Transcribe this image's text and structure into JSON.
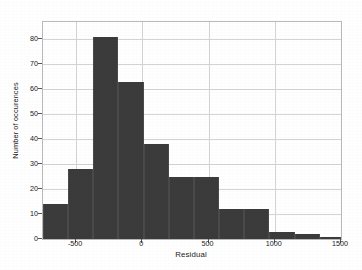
{
  "chart_data": {
    "type": "bar",
    "title": "",
    "subtitle": "",
    "xlabel": "Residual",
    "ylabel": "Number of occurences",
    "xlim": [
      -750,
      1500
    ],
    "ylim": [
      0,
      87
    ],
    "grid": true,
    "legend": null,
    "legend_position": "none",
    "bar_color": "#3b3b3b",
    "bin_width": 190,
    "xticks": [
      -500,
      0,
      500,
      1000,
      1500
    ],
    "xtick_labels": [
      "-500",
      "0",
      "500",
      "1000",
      "1500"
    ],
    "yticks": [
      0,
      10,
      20,
      30,
      40,
      50,
      60,
      70,
      80
    ],
    "ytick_labels": [
      "0",
      "10",
      "20",
      "30",
      "40",
      "50",
      "60",
      "70",
      "80"
    ],
    "bins": [
      {
        "left": -750,
        "right": -560,
        "value": 14
      },
      {
        "left": -560,
        "right": -370,
        "value": 28
      },
      {
        "left": -370,
        "right": -180,
        "value": 81
      },
      {
        "left": -180,
        "right": 10,
        "value": 63
      },
      {
        "left": 10,
        "right": 200,
        "value": 38
      },
      {
        "left": 200,
        "right": 390,
        "value": 25
      },
      {
        "left": 390,
        "right": 580,
        "value": 25
      },
      {
        "left": 580,
        "right": 770,
        "value": 12
      },
      {
        "left": 770,
        "right": 960,
        "value": 12
      },
      {
        "left": 960,
        "right": 1150,
        "value": 3
      },
      {
        "left": 1150,
        "right": 1340,
        "value": 2
      },
      {
        "left": 1340,
        "right": 1500,
        "value": 1
      }
    ],
    "categories": [
      "-655",
      "-465",
      "-275",
      "-85",
      "105",
      "295",
      "485",
      "675",
      "865",
      "1055",
      "1245",
      "1420"
    ],
    "values": [
      14,
      28,
      81,
      63,
      38,
      25,
      25,
      12,
      12,
      3,
      2,
      1
    ]
  }
}
